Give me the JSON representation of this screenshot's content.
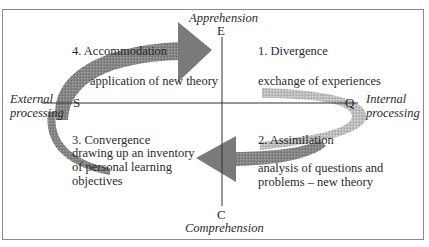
{
  "diagram": {
    "type": "learning-cycle",
    "axes": {
      "vertical": {
        "top_label": "E",
        "top_caption": "Apprehension",
        "bottom_label": "C",
        "bottom_caption": "Comprehension"
      },
      "horizontal": {
        "left_label": "S",
        "left_caption": "External\nprocessing",
        "right_label": "Q",
        "right_caption": "Internal\nprocessing"
      }
    },
    "quadrants": [
      {
        "id": 1,
        "title": "1. Divergence",
        "description": "exchange of experiences"
      },
      {
        "id": 2,
        "title": "2. Assimilation",
        "description": "analysis of questions and\nproblems – new theory"
      },
      {
        "id": 3,
        "title": "3. Convergence",
        "description": "drawing up an inventory\nof personal learning\nobjectives"
      },
      {
        "id": 4,
        "title": "4. Accommodation",
        "description": "application of new theory"
      }
    ],
    "colors": {
      "arrow": "#7a7a7a",
      "arrow_light": "#b5b5b5",
      "axis": "#333333",
      "frame": "#8a8a8a",
      "text": "#2a2a2a"
    }
  }
}
